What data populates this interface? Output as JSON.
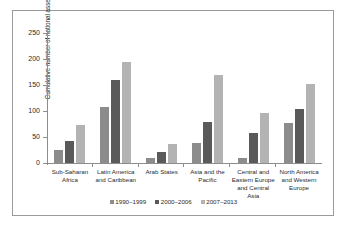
{
  "chart_data": {
    "type": "bar",
    "title": "",
    "xlabel": "",
    "ylabel": "Cumulative number of national assessments",
    "ylim": [
      0,
      250
    ],
    "yticks": [
      0,
      50,
      100,
      150,
      200,
      250
    ],
    "grid": false,
    "legend_position": "bottom",
    "categories": [
      "Sub-Saharan Africa",
      "Latin America and Caribbean",
      "Arab States",
      "Asia and the Pacific",
      "Central and Eastern Europe and Central Asia",
      "North America and Western Europe"
    ],
    "category_lines": [
      [
        "Sub-Saharan",
        "Africa"
      ],
      [
        "Latin America",
        "and Caribbean"
      ],
      [
        "Arab States"
      ],
      [
        "Asia and the",
        "Pacific"
      ],
      [
        "Central and",
        "Eastern Europe",
        "and Central Asia"
      ],
      [
        "North America",
        "and Western",
        "Europe"
      ]
    ],
    "series": [
      {
        "name": "1990–1999",
        "color": "#8c8c8c",
        "values": [
          25,
          108,
          9,
          38,
          10,
          77
        ]
      },
      {
        "name": "2000–2006",
        "color": "#5a5a5a",
        "values": [
          43,
          160,
          22,
          79,
          58,
          104
        ]
      },
      {
        "name": "2007–2013",
        "color": "#b3b3b3",
        "values": [
          73,
          194,
          37,
          170,
          96,
          152
        ]
      }
    ]
  }
}
